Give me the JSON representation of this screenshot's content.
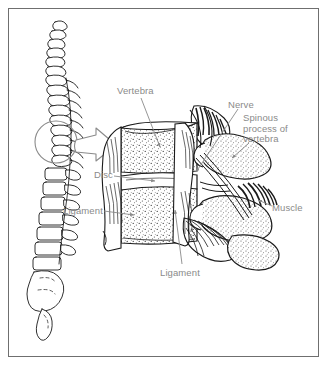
{
  "figure": {
    "border_color": "#6f6f6f",
    "background_color": "#ffffff",
    "label_color": "#8a8a8a",
    "ink_color": "#1a1a1a",
    "labels": [
      {
        "id": "vertebra",
        "text": "Vertebra",
        "x": 117,
        "y": 86,
        "lines": 1
      },
      {
        "id": "nerve",
        "text": "Nerve",
        "x": 228,
        "y": 100,
        "lines": 1
      },
      {
        "id": "spinous-process",
        "text": "Spinous\nprocess of\nvertebra",
        "x": 243,
        "y": 113,
        "lines": 3
      },
      {
        "id": "disc",
        "text": "Disc",
        "x": 94,
        "y": 170,
        "lines": 1
      },
      {
        "id": "ligament-left",
        "text": "Ligament",
        "x": 63,
        "y": 206,
        "lines": 1
      },
      {
        "id": "muscle",
        "text": "Muscle",
        "x": 272,
        "y": 203,
        "lines": 1
      },
      {
        "id": "ligament-bottom",
        "text": "Ligament",
        "x": 160,
        "y": 268,
        "lines": 1
      }
    ],
    "callout": {
      "circle": {
        "cx": 56,
        "cy": 142,
        "r": 21
      },
      "arrow_description": "hollow block arrow from circled spine segment to magnified view"
    },
    "parts": {
      "spine": "lateral view of full vertebral column with sacrum and coccyx",
      "magnified": "two lumbar vertebral bodies, intervertebral disc, ligaments, spinous processes, nerve and paraspinal muscle"
    }
  }
}
